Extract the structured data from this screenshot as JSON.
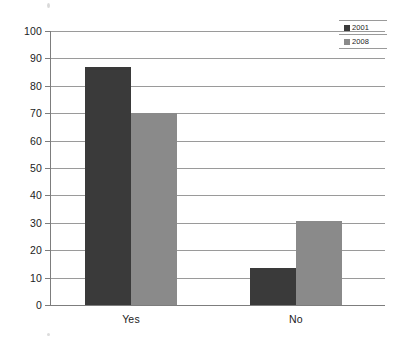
{
  "chart_data": {
    "type": "bar",
    "title": "",
    "subtitle": "",
    "xlabel": "",
    "ylabel": "",
    "categories": [
      "Yes",
      "No"
    ],
    "series": [
      {
        "name": "2001",
        "values": [
          87,
          13.5
        ],
        "color": "#3a3a3a"
      },
      {
        "name": "2008",
        "values": [
          70,
          30.5
        ],
        "color": "#8a8a8a"
      }
    ],
    "ylim": [
      0,
      100
    ],
    "ytick_step": 10,
    "ytick_labels": [
      "100",
      "90",
      "80",
      "70",
      "60",
      "50",
      "40",
      "30",
      "20",
      "10",
      "0"
    ],
    "grid": true,
    "grid_axis": "y",
    "legend_position": "top-right",
    "orientation": "vertical",
    "grouping": "grouped"
  },
  "legend": {
    "entries": [
      {
        "label": "2001",
        "color": "#3a3a3a"
      },
      {
        "label": "2008",
        "color": "#8a8a8a"
      }
    ]
  },
  "axes": {
    "y": {
      "ticks": [
        "100",
        "90",
        "80",
        "70",
        "60",
        "50",
        "40",
        "30",
        "20",
        "10",
        "0"
      ]
    },
    "x": {
      "categories": [
        "Yes",
        "No"
      ]
    }
  },
  "colors": {
    "series_2001": "#3a3a3a",
    "series_2008": "#8a8a8a",
    "gridline": "#9a9a9a",
    "axis": "#7d7d7d",
    "text": "#1c1c1c",
    "background": "#ffffff"
  }
}
